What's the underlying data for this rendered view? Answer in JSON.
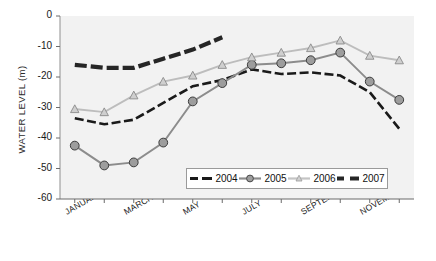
{
  "chart_data": {
    "type": "line",
    "title": "",
    "xlabel": "",
    "ylabel": "WATER LEVEL (m)",
    "ylim": [
      -60,
      0
    ],
    "yticks": [
      0,
      -10,
      -20,
      -30,
      -40,
      -50,
      -60
    ],
    "ytick_labels": [
      "0",
      "-10",
      "-20",
      "-30",
      "-40",
      "-50",
      "-60"
    ],
    "categories": [
      "JANUARY",
      "FEBRUARY",
      "MARCH",
      "APRIL",
      "MAY",
      "JUNE",
      "JULY",
      "AUGUST",
      "SEPTEMBER",
      "OCTOBER",
      "NOVEMBER",
      "DECEMBER"
    ],
    "xtick_labels": [
      "JANUARY",
      "MARCH",
      "MAY",
      "JULY",
      "SEPTEMBER",
      "NOVEMBER"
    ],
    "xtick_indices": [
      0,
      2,
      4,
      6,
      8,
      10
    ],
    "grid": false,
    "legend_position": "inside-bottom-right",
    "series": [
      {
        "name": "2004",
        "color": "#1a1a1a",
        "marker": "none",
        "style": "dashed-thick",
        "values": [
          -33.5,
          -35.5,
          -34.0,
          -28.5,
          -23.0,
          -21.0,
          -17.5,
          -19.0,
          -18.5,
          -19.5,
          -25.0,
          -37.0
        ]
      },
      {
        "name": "2005",
        "color": "#8c8c8c",
        "marker": "circle",
        "style": "solid",
        "values": [
          -42.5,
          -49.0,
          -48.0,
          -41.5,
          -28.0,
          -22.0,
          -16.0,
          -15.5,
          -14.5,
          -12.0,
          -21.5,
          -27.5
        ]
      },
      {
        "name": "2006",
        "color": "#bdbdbd",
        "marker": "triangle",
        "style": "solid",
        "values": [
          -30.5,
          -31.5,
          -26.0,
          -21.5,
          -19.5,
          -16.0,
          -13.5,
          -12.0,
          -10.5,
          -8.0,
          -13.0,
          -14.5
        ]
      },
      {
        "name": "2007",
        "color": "#262626",
        "marker": "none",
        "style": "dashed-heavy",
        "values": [
          -16.0,
          -17.0,
          -17.0,
          -14.0,
          -11.0,
          -7.0,
          null,
          null,
          null,
          null,
          null,
          null
        ]
      }
    ]
  },
  "legend": {
    "items": [
      {
        "label": "2004"
      },
      {
        "label": "2005"
      },
      {
        "label": "2006"
      },
      {
        "label": "2007"
      }
    ]
  },
  "axis": {
    "y_title": "WATER LEVEL (m)"
  }
}
